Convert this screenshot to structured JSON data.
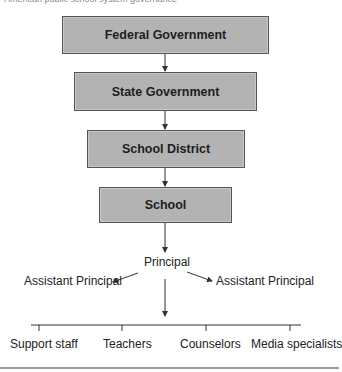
{
  "caption": "American public school system governance",
  "hierarchy": {
    "boxes": [
      {
        "id": "federal",
        "label": "Federal Government"
      },
      {
        "id": "state",
        "label": "State Government"
      },
      {
        "id": "district",
        "label": "School District"
      },
      {
        "id": "school",
        "label": "School"
      }
    ],
    "principal": "Principal",
    "assistants": [
      "Assistant Principal",
      "Assistant Principal"
    ],
    "staff": [
      "Support staff",
      "Teachers",
      "Counselors",
      "Media specialists"
    ]
  },
  "colors": {
    "box_fill": "#b3b3b3",
    "box_border": "#555555",
    "line": "#333333"
  }
}
